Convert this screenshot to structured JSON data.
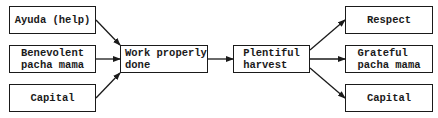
{
  "diagram": {
    "inputs": [
      {
        "label": "Ayuda (help)"
      },
      {
        "label": "Benevolent\npacha mama"
      },
      {
        "label": "Capital"
      }
    ],
    "process": {
      "label": "Work properly\ndone"
    },
    "result": {
      "label": "Plentiful\nharvest"
    },
    "outputs": [
      {
        "label": "Respect"
      },
      {
        "label": "Grateful\npacha mama"
      },
      {
        "label": "Capital"
      }
    ],
    "edges": [
      {
        "from": "Ayuda (help)",
        "to": "Work properly done"
      },
      {
        "from": "Benevolent pacha mama",
        "to": "Work properly done"
      },
      {
        "from": "Capital",
        "to": "Work properly done"
      },
      {
        "from": "Work properly done",
        "to": "Plentiful harvest"
      },
      {
        "from": "Plentiful harvest",
        "to": "Respect"
      },
      {
        "from": "Plentiful harvest",
        "to": "Grateful pacha mama"
      },
      {
        "from": "Plentiful harvest",
        "to": "Capital"
      }
    ]
  }
}
